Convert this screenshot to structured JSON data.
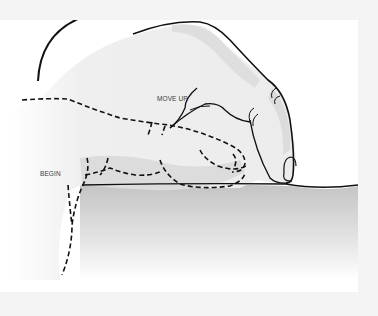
{
  "diagram": {
    "labels": {
      "move_up": "MOVE UP",
      "begin": "BEGIN"
    },
    "arrow": {
      "direction": "up-and-right",
      "meaning": "motion from begin position to move-up position"
    },
    "positions": [
      {
        "name": "begin",
        "style": "dashed outline",
        "description": "hand resting flat on surface"
      },
      {
        "name": "move-up",
        "style": "solid outline",
        "description": "hand raised with index fingertip on surface"
      }
    ],
    "colors": {
      "background": "#f4f4f4",
      "canvas": "#ffffff",
      "skin_light": "#ececec",
      "skin_shadow": "#d8d8d8",
      "surface_top": "#c8c8c8",
      "outline": "#111111"
    }
  }
}
